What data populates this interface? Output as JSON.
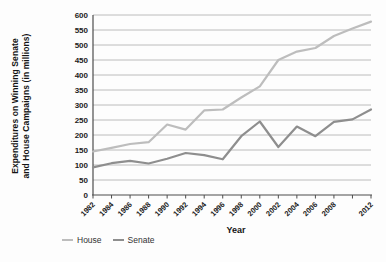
{
  "chart_data": {
    "type": "line",
    "x": [
      1982,
      1984,
      1986,
      1988,
      1990,
      1992,
      1994,
      1996,
      1998,
      2000,
      2002,
      2004,
      2006,
      2008,
      2010,
      2012
    ],
    "x_tick_labels": [
      "1982",
      "1984",
      "1986",
      "1988",
      "1990",
      "1992",
      "1994",
      "1996",
      "1998",
      "2000",
      "2002",
      "2004",
      "2006",
      "2008",
      "",
      "2012"
    ],
    "series": [
      {
        "name": "House",
        "color": "#bdbdbd",
        "values": [
          145,
          157,
          170,
          176,
          235,
          218,
          282,
          285,
          325,
          362,
          450,
          478,
          490,
          530,
          555,
          578
        ]
      },
      {
        "name": "Senate",
        "color": "#8e8e8e",
        "values": [
          92,
          106,
          114,
          105,
          121,
          140,
          133,
          119,
          196,
          245,
          160,
          228,
          196,
          244,
          252,
          285
        ]
      }
    ],
    "title": "",
    "xlabel": "Year",
    "ylabel_line1": "Expenditures on Winning Senate",
    "ylabel_line2": "and House Campaigns (in millions)",
    "ylim": [
      0,
      600
    ],
    "ytick_step": 50,
    "grid": true,
    "legend_position": "bottom-left",
    "colors": {
      "grid": "#ababab",
      "axis": "#4d4d4d",
      "text": "#1c1c1c"
    }
  }
}
